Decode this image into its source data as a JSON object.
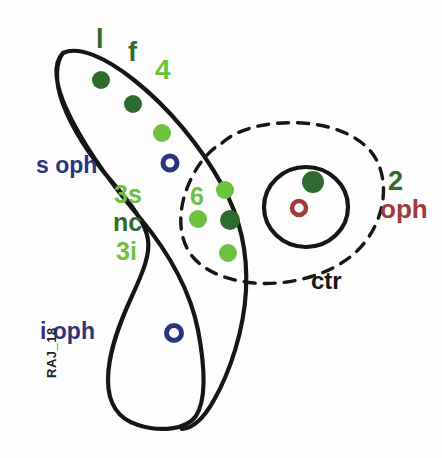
{
  "figure": {
    "signature": "RAJ_18",
    "background_color": "#fdfdfd",
    "outline_color": "#161616"
  },
  "palette": {
    "dark_green": "#2f6b2f",
    "light_green": "#6dc13f",
    "navy": "#2a3580",
    "dark_red": "#9e3b3b",
    "ink": "#161616"
  },
  "labels": {
    "l": "l",
    "f": "f",
    "four": "4",
    "s_oph": "s oph",
    "three_s": "3s",
    "nc": "nc",
    "three_i": "3i",
    "six": "6",
    "two": "2",
    "oph": "oph",
    "ctr": "ctr",
    "i_oph": "i oph"
  },
  "shapes": {
    "boomerang": {
      "name": "boomerang-outline",
      "stroke": "#161616",
      "stroke_width": 4,
      "fill": "none"
    },
    "dashed_oval": {
      "name": "dashed-oval-outline",
      "stroke": "#161616",
      "stroke_width": 3.4,
      "dash": "11 9",
      "fill": "none"
    },
    "right_circle": {
      "name": "right-circle-outline",
      "cx": 306,
      "cy": 207,
      "rx": 42,
      "ry": 40,
      "stroke": "#161616",
      "stroke_width": 4,
      "fill": "none"
    }
  },
  "markers": [
    {
      "id": "m1",
      "group": "upper-lobe",
      "type": "filled",
      "color": "#2f6b2f",
      "cx": 101,
      "cy": 80,
      "r": 9
    },
    {
      "id": "m2",
      "group": "upper-lobe",
      "type": "filled",
      "color": "#2f6b2f",
      "cx": 133,
      "cy": 104,
      "r": 9
    },
    {
      "id": "m3",
      "group": "upper-lobe",
      "type": "filled",
      "color": "#6dc13f",
      "cx": 162,
      "cy": 133,
      "r": 9
    },
    {
      "id": "m4",
      "group": "upper-lobe",
      "type": "ring",
      "color": "#2a3580",
      "cx": 170,
      "cy": 163,
      "r": 8
    },
    {
      "id": "m5",
      "group": "center-cluster",
      "type": "filled",
      "color": "#6dc13f",
      "cx": 225,
      "cy": 190,
      "r": 9
    },
    {
      "id": "m6",
      "group": "center-cluster",
      "type": "filled",
      "color": "#6dc13f",
      "cx": 198,
      "cy": 219,
      "r": 9
    },
    {
      "id": "m7",
      "group": "center-cluster",
      "type": "filled",
      "color": "#2f6b2f",
      "cx": 230,
      "cy": 220,
      "r": 10
    },
    {
      "id": "m8",
      "group": "center-cluster",
      "type": "filled",
      "color": "#6dc13f",
      "cx": 228,
      "cy": 253,
      "r": 9
    },
    {
      "id": "m9",
      "group": "right-circle",
      "type": "filled",
      "color": "#2f6b2f",
      "cx": 313,
      "cy": 182,
      "r": 11
    },
    {
      "id": "m10",
      "group": "right-circle",
      "type": "ring",
      "color": "#9e3b3b",
      "cx": 299,
      "cy": 208,
      "r": 8
    },
    {
      "id": "m11",
      "group": "lower-lobe",
      "type": "ring",
      "color": "#2a3580",
      "cx": 174,
      "cy": 333,
      "r": 9
    }
  ]
}
